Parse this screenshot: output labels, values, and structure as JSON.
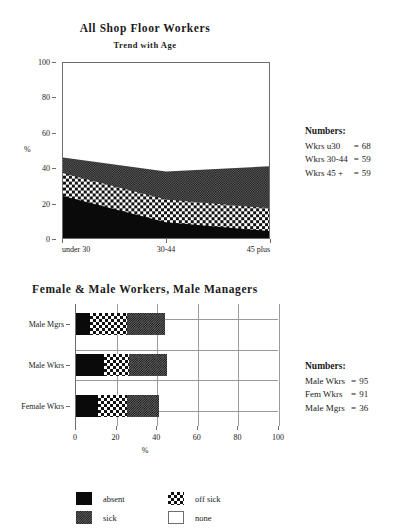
{
  "area_chart": {
    "title": "All Shop Floor Workers",
    "subtitle": "Trend with Age",
    "ylabel": "%",
    "yticks": [
      "0",
      "20",
      "40",
      "60",
      "80",
      "100"
    ],
    "xticks": [
      "under 30",
      "30-44",
      "45 plus"
    ]
  },
  "bar_chart": {
    "title": "Female & Male Workers, Male Managers",
    "xlabel": "%",
    "categories": [
      "Male Mgrs",
      "Male Wkrs",
      "Female Wkrs"
    ],
    "xticks": [
      "0",
      "20",
      "40",
      "60",
      "80",
      "100"
    ]
  },
  "legend": {
    "items": [
      {
        "label": "absent",
        "fill": "absent"
      },
      {
        "label": "off sick",
        "fill": "offsick"
      },
      {
        "label": "sick",
        "fill": "sick"
      },
      {
        "label": "none",
        "fill": "none"
      }
    ]
  },
  "numbers_top": {
    "heading": "Numbers:",
    "rows": [
      {
        "label": "Wkrs u30",
        "eq": "=",
        "value": "68"
      },
      {
        "label": "Wkrs 30-44",
        "eq": "=",
        "value": "59"
      },
      {
        "label": "Wkrs 45 +",
        "eq": "=",
        "value": "59"
      }
    ]
  },
  "numbers_bottom": {
    "heading": "Numbers:",
    "rows": [
      {
        "label": "Male Wkrs",
        "eq": "=",
        "value": "95"
      },
      {
        "label": "Fem Wkrs",
        "eq": "=",
        "value": "91"
      },
      {
        "label": "Male Mgrs",
        "eq": "=",
        "value": "36"
      }
    ]
  },
  "chart_data": [
    {
      "type": "area",
      "title": "All Shop Floor Workers",
      "subtitle": "Trend with Age",
      "xlabel": "",
      "ylabel": "%",
      "ylim": [
        0,
        100
      ],
      "categories": [
        "under 30",
        "30-44",
        "45 plus"
      ],
      "stacked": true,
      "grid": false,
      "series": [
        {
          "name": "absent",
          "values": [
            24,
            9,
            4
          ]
        },
        {
          "name": "off sick",
          "values": [
            13,
            13,
            13
          ]
        },
        {
          "name": "sick",
          "values": [
            9,
            16,
            24
          ]
        }
      ],
      "cumulative_tops": {
        "absent": [
          24,
          9,
          4
        ],
        "off_sick": [
          37,
          22,
          17
        ],
        "sick": [
          46,
          38,
          41
        ]
      },
      "annotations": [
        "Wkrs u30 = 68",
        "Wkrs 30-44 = 59",
        "Wkrs 45 + = 59"
      ]
    },
    {
      "type": "bar",
      "orientation": "horizontal",
      "title": "Female & Male Workers, Male Managers",
      "xlabel": "%",
      "ylabel": "",
      "xlim": [
        0,
        100
      ],
      "grid": true,
      "stacked": true,
      "categories": [
        "Male Mgrs",
        "Male Wkrs",
        "Female Wkrs"
      ],
      "series": [
        {
          "name": "absent",
          "values": [
            7,
            14,
            11
          ]
        },
        {
          "name": "off sick",
          "values": [
            18,
            12,
            14
          ]
        },
        {
          "name": "sick",
          "values": [
            19,
            19,
            16
          ]
        }
      ],
      "cumulative_ends": {
        "absent": [
          7,
          14,
          11
        ],
        "off_sick": [
          25,
          26,
          25
        ],
        "sick": [
          44,
          45,
          41
        ]
      },
      "annotations": [
        "Male Wkrs = 95",
        "Fem Wkrs = 91",
        "Male Mgrs = 36"
      ]
    }
  ]
}
